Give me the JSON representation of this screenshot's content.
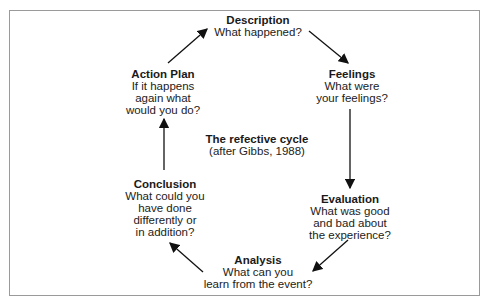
{
  "title": "The refective cycle",
  "subtitle": "(after Gibbs, 1988)",
  "nodes": {
    "description": {
      "title": "Description",
      "lines": [
        "What happened?"
      ]
    },
    "feelings": {
      "title": "Feelings",
      "lines": [
        "What were",
        "your feelings?"
      ]
    },
    "evaluation": {
      "title": "Evaluation",
      "lines": [
        "What was good",
        "and bad about",
        "the experience?"
      ]
    },
    "analysis": {
      "title": "Analysis",
      "lines": [
        "What can you",
        "learn from the event?"
      ]
    },
    "conclusion": {
      "title": "Conclusion",
      "lines": [
        "What could you",
        "have done",
        "differently or",
        "in addition?"
      ]
    },
    "action_plan": {
      "title": "Action Plan",
      "lines": [
        "If it happens",
        "again what",
        "would you do?"
      ]
    }
  }
}
